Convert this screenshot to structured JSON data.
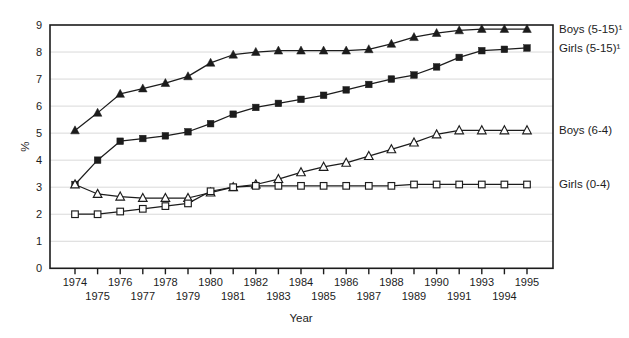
{
  "figure": {
    "background": "#ffffff",
    "ink_color": "#1c1c1c",
    "grid_color": "#d9d9d9"
  },
  "chart_data": {
    "type": "line",
    "title": "",
    "xlabel": "Year",
    "ylabel": "%",
    "ylim": [
      0,
      9
    ],
    "ytick_interval": 1,
    "yticks": [
      "0",
      "1",
      "2",
      "3",
      "4",
      "5",
      "6",
      "7",
      "8",
      "9"
    ],
    "grid": "horizontal-light",
    "legend_position": "right-edge-labels-at-series-end",
    "x_tick_label_layout": "staggered-two-rows",
    "x_tick_labels": [
      "1974",
      "1975",
      "1976",
      "1977",
      "1978",
      "1979",
      "1980",
      "1981",
      "1982",
      "1983",
      "1984",
      "1985",
      "1986",
      "1987",
      "1988",
      "1989",
      "1990",
      "1991",
      "1993",
      "1994",
      "1995"
    ],
    "series": [
      {
        "name": "Boys (5-15)¹",
        "marker": "filled-triangle",
        "values": [
          5.1,
          5.75,
          6.45,
          6.65,
          6.85,
          7.1,
          7.6,
          7.9,
          8.0,
          8.05,
          8.05,
          8.05,
          8.05,
          8.1,
          8.3,
          8.55,
          8.7,
          8.8,
          8.85,
          8.85,
          8.85
        ]
      },
      {
        "name": "Girls (5-15)¹",
        "marker": "filled-square",
        "values": [
          3.1,
          4.0,
          4.7,
          4.8,
          4.9,
          5.05,
          5.35,
          5.7,
          5.95,
          6.1,
          6.25,
          6.4,
          6.6,
          6.8,
          7.0,
          7.15,
          7.45,
          7.8,
          8.05,
          8.1,
          8.15
        ]
      },
      {
        "name": "Boys (6-4)",
        "marker": "open-triangle",
        "values": [
          3.1,
          2.75,
          2.65,
          2.6,
          2.6,
          2.6,
          2.8,
          3.0,
          3.1,
          3.3,
          3.55,
          3.75,
          3.9,
          4.15,
          4.4,
          4.65,
          4.95,
          5.1,
          5.1,
          5.1,
          5.1
        ]
      },
      {
        "name": "Girls (0-4)",
        "marker": "open-square",
        "values": [
          2.0,
          2.0,
          2.1,
          2.2,
          2.3,
          2.4,
          2.85,
          3.0,
          3.05,
          3.05,
          3.05,
          3.05,
          3.05,
          3.05,
          3.05,
          3.1,
          3.1,
          3.1,
          3.1,
          3.1,
          3.1
        ]
      }
    ]
  }
}
